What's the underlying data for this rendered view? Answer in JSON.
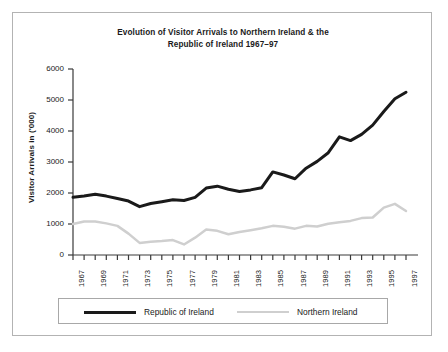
{
  "chart_data": {
    "type": "line",
    "title": "Evolution of Visitor Arrivals to Northern Ireland & the Republic of Ireland 1967–97",
    "title_line1": "Evolution of Visitor Arrivals to Northern Ireland & the",
    "title_line2": "Republic of Ireland 1967–97",
    "xlabel": "",
    "ylabel": "Visitor Arrivals in ('000)",
    "ylim": [
      0,
      6000
    ],
    "xlim": [
      1967,
      1997
    ],
    "y_ticks": [
      0,
      1000,
      2000,
      3000,
      4000,
      5000,
      6000
    ],
    "y_tick_labels": [
      "0",
      "1000",
      "2000",
      "3000",
      "4000",
      "5000",
      "6000"
    ],
    "grid": false,
    "legend_position": "bottom",
    "x": [
      1967,
      1968,
      1969,
      1970,
      1971,
      1972,
      1973,
      1974,
      1975,
      1976,
      1977,
      1978,
      1979,
      1980,
      1981,
      1982,
      1983,
      1984,
      1985,
      1986,
      1987,
      1988,
      1989,
      1990,
      1991,
      1992,
      1993,
      1994,
      1995,
      1996,
      1997
    ],
    "x_tick_labels": [
      "1967",
      "1969",
      "1971",
      "1973",
      "1975",
      "1977",
      "1979",
      "1981",
      "1983",
      "1985",
      "1987",
      "1989",
      "1991",
      "1993",
      "1995",
      "1997"
    ],
    "x_tick_values": [
      1967,
      1969,
      1971,
      1973,
      1975,
      1977,
      1979,
      1981,
      1983,
      1985,
      1987,
      1989,
      1991,
      1993,
      1995,
      1997
    ],
    "series": [
      {
        "name": "Republic of Ireland",
        "color": "#1a1a1a",
        "width": 3,
        "values": [
          1860,
          1900,
          1960,
          1900,
          1820,
          1740,
          1560,
          1660,
          1720,
          1780,
          1760,
          1860,
          2160,
          2220,
          2120,
          2050,
          2100,
          2170,
          2680,
          2580,
          2460,
          2800,
          3020,
          3300,
          3810,
          3690,
          3890,
          4190,
          4630,
          5040,
          5250
        ]
      },
      {
        "name": "Northern Ireland",
        "color": "#cfcfcf",
        "width": 2.5,
        "values": [
          1000,
          1080,
          1080,
          1020,
          940,
          690,
          390,
          430,
          450,
          480,
          340,
          560,
          820,
          780,
          670,
          740,
          800,
          860,
          940,
          910,
          850,
          940,
          920,
          1010,
          1060,
          1100,
          1190,
          1210,
          1530,
          1650,
          1420
        ]
      }
    ]
  },
  "legend": {
    "entries": [
      {
        "label": "Republic of Ireland",
        "swatch": "roi"
      },
      {
        "label": "Northern Ireland",
        "swatch": "ni"
      }
    ]
  }
}
